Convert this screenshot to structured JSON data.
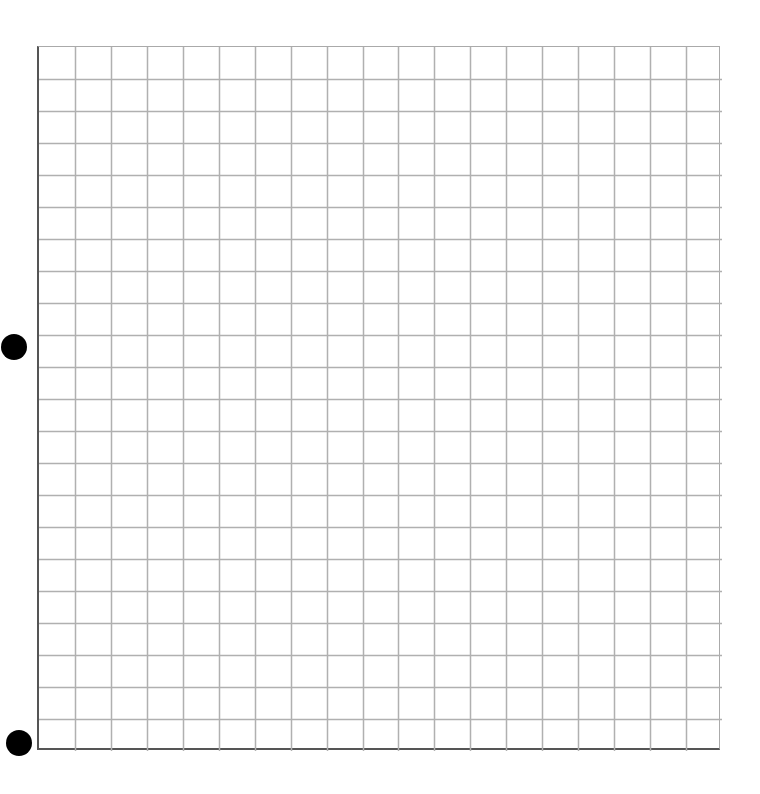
{
  "grid": {
    "columns": 19,
    "rows": 22,
    "line_color": "#b0b0b0",
    "axis_color": "#555555"
  },
  "markers": [
    {
      "name": "marker-dot-middle",
      "x": 14,
      "y": 347,
      "diameter": 26
    },
    {
      "name": "marker-dot-bottom",
      "x": 19,
      "y": 743,
      "diameter": 26
    }
  ]
}
